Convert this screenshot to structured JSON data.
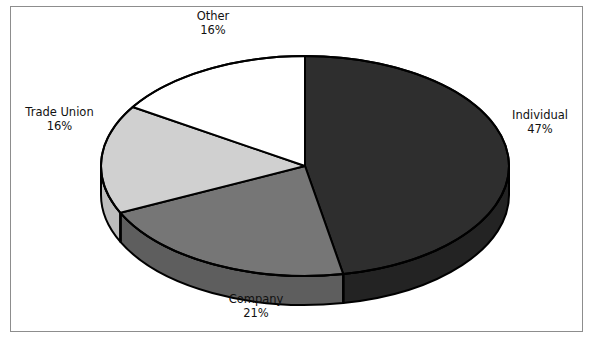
{
  "figure": {
    "title": "",
    "border_color": "#8d8d8d",
    "background": "#ffffff"
  },
  "chart_data": {
    "type": "pie",
    "title": "",
    "subtitle": "",
    "xlabel": "",
    "ylabel": "",
    "three_d": true,
    "start_angle_deg": 0,
    "direction": "clockwise",
    "legend": "none",
    "grid": false,
    "categories": [
      "Individual",
      "Company",
      "Trade Union",
      "Other"
    ],
    "values": [
      47,
      21,
      16,
      16
    ],
    "unit": "%",
    "slices": [
      {
        "label": "Individual",
        "value": 47,
        "value_text": "47%",
        "color": "#2e2e2e",
        "side_color": "#232323",
        "label_position": "right"
      },
      {
        "label": "Company",
        "value": 21,
        "value_text": "21%",
        "color": "#767676",
        "side_color": "#5e5e5e",
        "label_position": "bottom"
      },
      {
        "label": "Trade Union",
        "value": 16,
        "value_text": "16%",
        "color": "#d0d0d0",
        "side_color": "#bdbdbd",
        "label_position": "left"
      },
      {
        "label": "Other",
        "value": 16,
        "value_text": "16%",
        "color": "#ffffff",
        "side_color": "#eeeeee",
        "label_position": "top"
      }
    ],
    "outline_color": "#000000"
  },
  "labels": {
    "other": {
      "name": "Other",
      "pct": "16%"
    },
    "trade_union": {
      "name": "Trade Union",
      "pct": "16%"
    },
    "individual": {
      "name": "Individual",
      "pct": "47%"
    },
    "company": {
      "name": "Company",
      "pct": "21%"
    }
  }
}
